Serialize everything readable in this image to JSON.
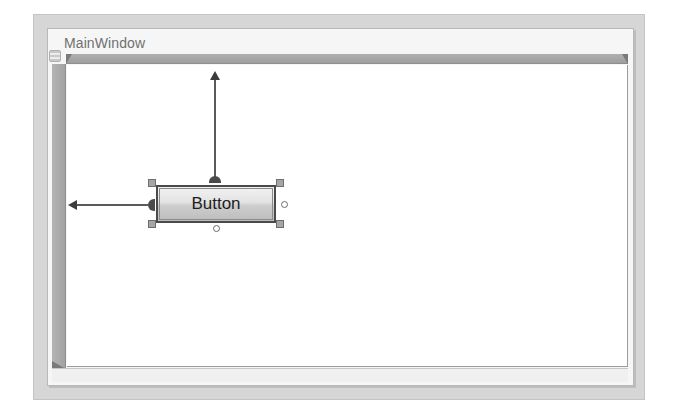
{
  "designer": {
    "window_title": "MainWindow",
    "grid_icon": "grid-icon",
    "button": {
      "label": "Button",
      "margin_indicators": [
        "top-margin-arrow",
        "left-margin-arrow"
      ],
      "resize_handles": [
        "top-left",
        "top-right",
        "bottom-left",
        "bottom-right"
      ],
      "anchor_toggles": [
        "right",
        "bottom"
      ]
    }
  },
  "colors": {
    "outer_frame": "#d6d6d6",
    "ruler": "#a8a8a8",
    "canvas": "#ffffff",
    "button_border": "#4a4a4a",
    "title_text": "#707070"
  }
}
